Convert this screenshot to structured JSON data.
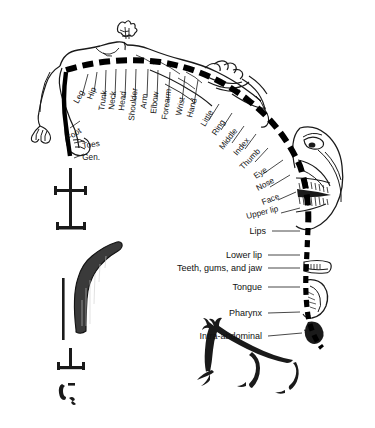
{
  "diagram": {
    "type": "anatomical-illustration",
    "background_color": "#ffffff",
    "ink_color": "#1a1a1a",
    "band_color": "#000000"
  },
  "radial_labels": [
    {
      "text": "Leg",
      "x": 78,
      "y": 104,
      "rotate": -62,
      "lx1": 82,
      "ly1": 96,
      "lx2": 88,
      "ly2": 74
    },
    {
      "text": "Hip",
      "x": 92,
      "y": 100,
      "rotate": -70,
      "lx1": 94,
      "ly1": 92,
      "lx2": 97,
      "ly2": 72
    },
    {
      "text": "Trunk",
      "x": 104,
      "y": 111,
      "rotate": -82,
      "lx1": 105,
      "ly1": 98,
      "lx2": 106,
      "ly2": 70
    },
    {
      "text": "Neck",
      "x": 114,
      "y": 110,
      "rotate": -84,
      "lx1": 115,
      "ly1": 97,
      "lx2": 116,
      "ly2": 69
    },
    {
      "text": "Head",
      "x": 124,
      "y": 111,
      "rotate": -84,
      "lx1": 125,
      "ly1": 98,
      "lx2": 126,
      "ly2": 69
    },
    {
      "text": "Shoulder",
      "x": 134,
      "y": 121,
      "rotate": -84,
      "lx1": 135,
      "ly1": 101,
      "lx2": 136,
      "ly2": 69
    },
    {
      "text": "Arm",
      "x": 146,
      "y": 109,
      "rotate": -84,
      "lx1": 147,
      "ly1": 97,
      "lx2": 148,
      "ly2": 69
    },
    {
      "text": "Elbow",
      "x": 156,
      "y": 114,
      "rotate": -84,
      "lx1": 157,
      "ly1": 99,
      "lx2": 158,
      "ly2": 70
    },
    {
      "text": "Forearm",
      "x": 167,
      "y": 120,
      "rotate": -82,
      "lx1": 168,
      "ly1": 102,
      "lx2": 170,
      "ly2": 72
    },
    {
      "text": "Wrist",
      "x": 181,
      "y": 116,
      "rotate": -78,
      "lx1": 182,
      "ly1": 102,
      "lx2": 185,
      "ly2": 76
    },
    {
      "text": "Hand",
      "x": 192,
      "y": 118,
      "rotate": -76,
      "lx1": 194,
      "ly1": 104,
      "lx2": 198,
      "ly2": 80
    },
    {
      "text": "Little",
      "x": 205,
      "y": 127,
      "rotate": -60,
      "lx1": 209,
      "ly1": 120,
      "lx2": 219,
      "ly2": 104
    },
    {
      "text": "Ring",
      "x": 216,
      "y": 136,
      "rotate": -56,
      "lx1": 221,
      "ly1": 130,
      "lx2": 232,
      "ly2": 113
    },
    {
      "text": "Middle",
      "x": 223,
      "y": 150,
      "rotate": -52,
      "lx1": 232,
      "ly1": 143,
      "lx2": 244,
      "ly2": 126
    },
    {
      "text": "Index",
      "x": 237,
      "y": 156,
      "rotate": -50,
      "lx1": 245,
      "ly1": 149,
      "lx2": 256,
      "ly2": 134
    },
    {
      "text": "Thumb",
      "x": 243,
      "y": 170,
      "rotate": -46,
      "lx1": 255,
      "ly1": 162,
      "lx2": 268,
      "ly2": 148
    },
    {
      "text": "Eye",
      "x": 256,
      "y": 179,
      "rotate": -34,
      "lx1": 263,
      "ly1": 174,
      "lx2": 283,
      "ly2": 160
    },
    {
      "text": "Nose",
      "x": 258,
      "y": 191,
      "rotate": -28,
      "lx1": 270,
      "ly1": 187,
      "lx2": 290,
      "ly2": 175
    },
    {
      "text": "Face",
      "x": 263,
      "y": 205,
      "rotate": -22,
      "lx1": 278,
      "ly1": 200,
      "lx2": 296,
      "ly2": 192
    },
    {
      "text": "Upper lip",
      "x": 247,
      "y": 219,
      "rotate": -14,
      "lx1": 281,
      "ly1": 213,
      "lx2": 300,
      "ly2": 208
    }
  ],
  "side_labels": [
    {
      "text": "Foot",
      "x": 82,
      "y": 132,
      "rotate": -34,
      "lx1": 70,
      "ly1": 128,
      "lx2": 80,
      "ly2": 121
    },
    {
      "text": "Toes",
      "x": 100,
      "y": 146,
      "rotate": -8,
      "lx1": 74,
      "ly1": 143,
      "lx2": 84,
      "ly2": 141
    },
    {
      "text": "Gen.",
      "x": 100,
      "y": 160,
      "rotate": 0,
      "lx1": 74,
      "ly1": 158,
      "lx2": 84,
      "ly2": 154
    }
  ],
  "horizontal_labels": [
    {
      "text": "Lips",
      "x": 266,
      "y": 234,
      "lx1": 272,
      "ly1": 231,
      "lx2": 300,
      "ly2": 231
    },
    {
      "text": "Lower lip",
      "x": 262,
      "y": 258,
      "lx1": 268,
      "ly1": 255,
      "lx2": 300,
      "ly2": 255
    },
    {
      "text": "Teeth, gums, and jaw",
      "x": 262,
      "y": 271,
      "lx1": 268,
      "ly1": 268,
      "lx2": 300,
      "ly2": 268
    },
    {
      "text": "Tongue",
      "x": 262,
      "y": 290,
      "lx1": 268,
      "ly1": 287,
      "lx2": 300,
      "ly2": 287
    },
    {
      "text": "Pharynx",
      "x": 262,
      "y": 316,
      "lx1": 268,
      "ly1": 313,
      "lx2": 300,
      "ly2": 312
    },
    {
      "text": "Intra-abdominal",
      "x": 262,
      "y": 339,
      "lx1": 268,
      "ly1": 336,
      "lx2": 302,
      "ly2": 333
    }
  ]
}
